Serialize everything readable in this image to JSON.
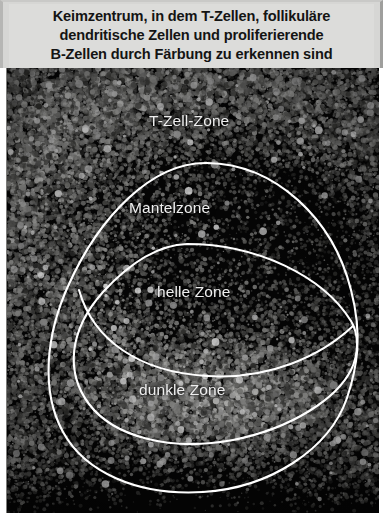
{
  "figure": {
    "caption": {
      "line1": "Keimzentrum, in dem T-Zellen, follikuläre",
      "line2": "dendritische Zellen und proliferierende",
      "line3": "B-Zellen durch Färbung zu erkennen sind"
    },
    "micrograph": {
      "type": "histology-micrograph",
      "background_color": "#050505",
      "stain_color": "#b9b9b9",
      "annotation_color": "#ffffff",
      "labels": [
        {
          "id": "t-zell-zone",
          "text": "T-Zell-Zone"
        },
        {
          "id": "mantelzone",
          "text": "Mantelzone"
        },
        {
          "id": "helle-zone",
          "text": "helle Zone"
        },
        {
          "id": "dunkle-zone",
          "text": "dunkle Zone"
        }
      ]
    },
    "colors": {
      "caption_background": "#dcdcda",
      "caption_text": "#141414",
      "image_background": "#050505",
      "outline": "#ffffff",
      "label_text": "#efefef"
    }
  }
}
